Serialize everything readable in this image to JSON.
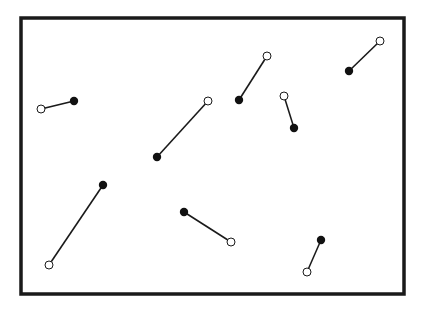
{
  "diagram": {
    "frame": {
      "x": 21,
      "y": 18,
      "width": 383,
      "height": 276,
      "stroke": "#1a1a1a"
    },
    "line_color": "#1a1a1a",
    "filled_color": "#111111",
    "open_fill": "#ffffff",
    "segments": [
      {
        "open": [
          41,
          109
        ],
        "filled": [
          74,
          101
        ]
      },
      {
        "open": [
          208,
          101
        ],
        "filled": [
          157,
          157
        ]
      },
      {
        "open": [
          267,
          56
        ],
        "filled": [
          239,
          100
        ]
      },
      {
        "open": [
          284,
          96
        ],
        "filled": [
          294,
          128
        ]
      },
      {
        "open": [
          380,
          41
        ],
        "filled": [
          349,
          71
        ]
      },
      {
        "open": [
          49,
          265
        ],
        "filled": [
          103,
          185
        ]
      },
      {
        "open": [
          231,
          242
        ],
        "filled": [
          184,
          212
        ]
      },
      {
        "open": [
          307,
          272
        ],
        "filled": [
          321,
          240
        ]
      }
    ]
  }
}
